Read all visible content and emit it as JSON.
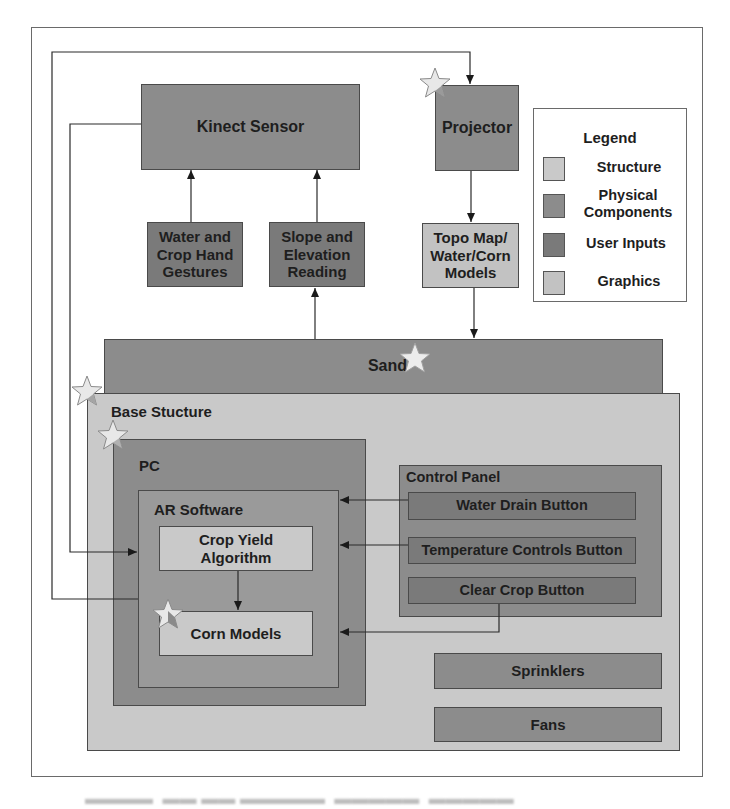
{
  "colors": {
    "structure": "#c9c9c9",
    "physical_components": "#8c8c8c",
    "user_inputs": "#7a7a7a",
    "graphics": "#c2c2c2",
    "line": "#2a2a2a",
    "frame": "#6a6a6a"
  },
  "nodes": {
    "kinect_sensor": "Kinect Sensor",
    "projector": "Projector",
    "hand_gestures": "Water and Crop Hand Gestures",
    "slope_elevation": "Slope and Elevation Reading",
    "topo_map": "Topo Map/ Water/Corn Models",
    "sand": "Sand",
    "base_structure": "Base Stucture",
    "pc": "PC",
    "ar_software": "AR Software",
    "crop_yield": "Crop Yield Algorithm",
    "corn_models": "Corn Models",
    "control_panel": "Control Panel",
    "water_drain_button": "Water Drain Button",
    "temperature_controls_button": "Temperature Controls Button",
    "clear_crop_button": "Clear Crop Button",
    "sprinklers": "Sprinklers",
    "fans": "Fans"
  },
  "legend": {
    "title": "Legend",
    "items": [
      {
        "label": "Structure",
        "color": "#c9c9c9"
      },
      {
        "label": "Physical Components",
        "color": "#8c8c8c"
      },
      {
        "label": "User Inputs",
        "color": "#7a7a7a"
      },
      {
        "label": "Graphics",
        "color": "#c2c2c2"
      }
    ]
  },
  "edges": [
    {
      "from": "Kinect Sensor",
      "to": "Projector"
    },
    {
      "from": "Kinect Sensor",
      "to": "Crop Yield Algorithm"
    },
    {
      "from": "Water and Crop Hand Gestures",
      "to": "Kinect Sensor"
    },
    {
      "from": "Slope and Elevation Reading",
      "to": "Kinect Sensor"
    },
    {
      "from": "Sand",
      "to": "Slope and Elevation Reading"
    },
    {
      "from": "Projector",
      "to": "Topo Map/ Water/Corn Models"
    },
    {
      "from": "Topo Map/ Water/Corn Models",
      "to": "Sand"
    },
    {
      "from": "AR Software",
      "to": "Projector"
    },
    {
      "from": "Crop Yield Algorithm",
      "to": "Corn Models"
    },
    {
      "from": "Water Drain Button",
      "to": "AR Software"
    },
    {
      "from": "Temperature Controls Button",
      "to": "AR Software"
    },
    {
      "from": "Clear Crop Button",
      "to": "AR Software"
    }
  ],
  "starred": [
    "Projector",
    "Sand",
    "Base Stucture",
    "PC",
    "Corn Models"
  ]
}
